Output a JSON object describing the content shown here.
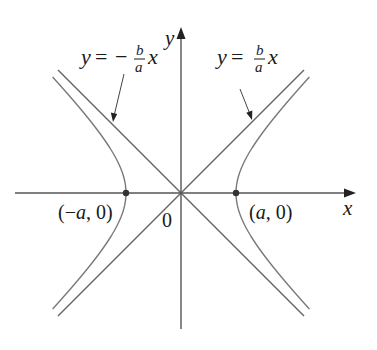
{
  "diagram": {
    "type": "hyperbola",
    "equation_form": "x^2/a^2 - y^2/b^2 = 1",
    "colors": {
      "axis": "#555555",
      "curve": "#7a7a7a",
      "asymptote": "#666666",
      "text": "#1a1a1a",
      "vertex": "#333333",
      "background": "#ffffff"
    },
    "geometry": {
      "origin": [
        181,
        193
      ],
      "a_px": 55,
      "b_px": 55,
      "x_axis": {
        "from": 15,
        "to": 356
      },
      "y_axis": {
        "from": 329,
        "to": 27
      },
      "curve_y_extent": 116,
      "asymptote_extent": 123
    },
    "axes": {
      "x_label": "x",
      "y_label": "y",
      "origin_label": "0"
    },
    "vertices": [
      {
        "name": "left-vertex",
        "label": "(−a, 0)",
        "label_var": "a"
      },
      {
        "name": "right-vertex",
        "label": "(a, 0)",
        "label_var": "a"
      }
    ],
    "asymptotes": [
      {
        "name": "negative-asymptote",
        "label_y": "y",
        "label_eq": "=",
        "label_sign": "−",
        "label_num": "b",
        "label_den": "a",
        "label_x": "x"
      },
      {
        "name": "positive-asymptote",
        "label_y": "y",
        "label_eq": "=",
        "label_sign": "",
        "label_num": "b",
        "label_den": "a",
        "label_x": "x"
      }
    ]
  }
}
